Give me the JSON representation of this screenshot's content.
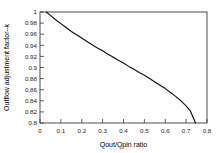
{
  "chart_data": {
    "type": "line",
    "title": "",
    "subtitle": "",
    "xlabel": "Qout/Qpin ratio",
    "ylabel": "Outflow adjustment factor–k",
    "xlim": [
      0,
      0.8
    ],
    "ylim": [
      0.8,
      1.0
    ],
    "xticks": [
      0,
      0.1,
      0.2,
      0.3,
      0.4,
      0.5,
      0.6,
      0.7,
      0.8
    ],
    "yticks": [
      0.8,
      0.82,
      0.84,
      0.86,
      0.88,
      0.9,
      0.92,
      0.94,
      0.96,
      0.98,
      1.0
    ],
    "xtick_labels": [
      "0",
      "0.1",
      "0.2",
      "0.3",
      "0.4",
      "0.5",
      "0.6",
      "0.7",
      "0.8"
    ],
    "ytick_labels": [
      "0.8",
      "0.82",
      "0.84",
      "0.86",
      "0.88",
      "0.9",
      "0.92",
      "0.94",
      "0.96",
      "0.98",
      "1"
    ],
    "grid": false,
    "legend": false,
    "legend_position": "none",
    "border_box": true,
    "line_color": "#101010",
    "axis_color": "#3a3a3a",
    "background_color": "#ffffff",
    "series": [
      {
        "name": "Outflow adjustment factor",
        "x": [
          0.03,
          0.05,
          0.075,
          0.1,
          0.125,
          0.15,
          0.175,
          0.2,
          0.225,
          0.25,
          0.275,
          0.3,
          0.325,
          0.35,
          0.375,
          0.4,
          0.425,
          0.45,
          0.475,
          0.5,
          0.525,
          0.55,
          0.575,
          0.6,
          0.625,
          0.65,
          0.675,
          0.7,
          0.72,
          0.745
        ],
        "y": [
          1.0,
          0.994,
          0.986,
          0.979,
          0.972,
          0.965,
          0.959,
          0.953,
          0.947,
          0.941,
          0.935,
          0.93,
          0.924,
          0.919,
          0.913,
          0.908,
          0.902,
          0.897,
          0.891,
          0.886,
          0.88,
          0.874,
          0.868,
          0.862,
          0.855,
          0.848,
          0.84,
          0.831,
          0.822,
          0.8
        ]
      }
    ]
  },
  "axes": {
    "x_title": "Qout/Qpin ratio",
    "y_title": "Outflow adjustment factor–k"
  }
}
